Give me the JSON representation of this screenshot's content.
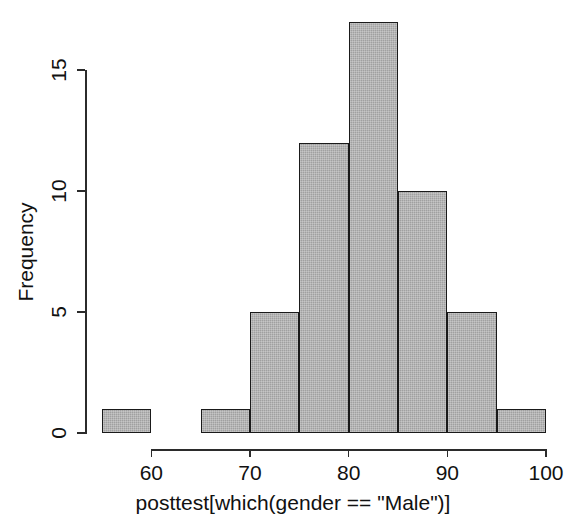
{
  "chart_data": {
    "type": "bar",
    "title": "",
    "subtitle": "",
    "xlabel": "posttest[which(gender == \"Male\")]",
    "ylabel": "Frequency",
    "bin_width": 5,
    "bin_edges": [
      55,
      60,
      65,
      70,
      75,
      80,
      85,
      90,
      95,
      100
    ],
    "categories": [
      "55-60",
      "60-65",
      "65-70",
      "70-75",
      "75-80",
      "80-85",
      "85-90",
      "90-95",
      "95-100"
    ],
    "bin_centers": [
      57.5,
      62.5,
      67.5,
      72.5,
      77.5,
      82.5,
      87.5,
      92.5,
      97.5
    ],
    "values": [
      1,
      0,
      1,
      5,
      12,
      17,
      10,
      5,
      1
    ],
    "xlim": [
      55,
      100
    ],
    "ylim": [
      0,
      17
    ],
    "xticks": [
      60,
      70,
      80,
      90,
      100
    ],
    "xtick_labels": [
      "60",
      "70",
      "80",
      "90",
      "100"
    ],
    "yticks": [
      0,
      5,
      10,
      15
    ],
    "ytick_labels": [
      "0",
      "5",
      "10",
      "15"
    ],
    "grid": false,
    "legend": false,
    "legend_position": "none",
    "bar_fill_color": "#a0a0a0",
    "bar_border_color": "#1a1a1a",
    "axis_color": "#2b2b2b",
    "background_color": "#ffffff",
    "total_count": 52
  }
}
